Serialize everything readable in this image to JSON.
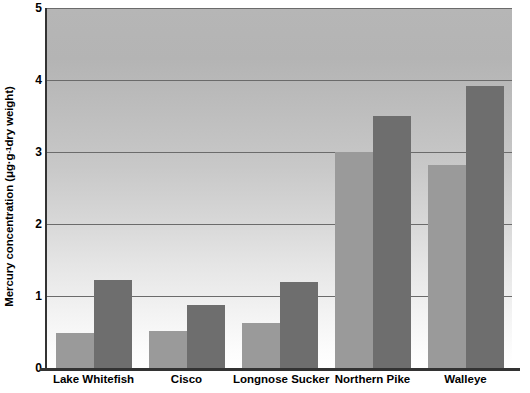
{
  "chart_data": {
    "type": "bar",
    "title": "",
    "xlabel": "",
    "ylabel": "Mercury concentration (μg·g⁻¹ dry weight)",
    "ylabel_parts": {
      "prefix": "Mercury concentration (μg·g",
      "exponent": "-1",
      "suffix": " dry weight)"
    },
    "categories": [
      "Lake Whitefish",
      "Cisco",
      "Longnose Sucker",
      "Northern Pike",
      "Walleye"
    ],
    "series": [
      {
        "name": "light",
        "color": "#9a9a9a",
        "values": [
          0.49,
          0.51,
          0.62,
          3.0,
          2.82
        ]
      },
      {
        "name": "dark",
        "color": "#6e6e6e",
        "values": [
          1.22,
          0.88,
          1.2,
          3.5,
          3.92
        ]
      }
    ],
    "ylim": [
      0,
      5
    ],
    "yticks": [
      0,
      1,
      2,
      3,
      4,
      5
    ],
    "ytick_labels": [
      "0",
      "1",
      "2",
      "3",
      "4",
      "5"
    ],
    "grid": true,
    "gridlines_at": [
      1,
      2,
      3,
      4,
      5
    ],
    "legend": "none",
    "background": {
      "plot_gradient_top": "#b6b6b6",
      "plot_gradient_bottom": "#ffffff",
      "page": "#ffffff"
    },
    "axis_color": "#333333",
    "gridline_color": "#6b6b6b"
  }
}
